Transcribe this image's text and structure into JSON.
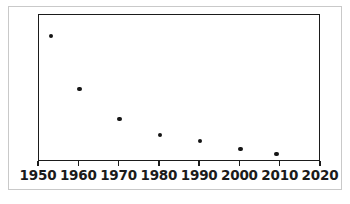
{
  "chart_data": {
    "type": "scatter",
    "title": "",
    "subtitle": "",
    "xlabel": "",
    "ylabel": "",
    "xlim": [
      1950,
      2020
    ],
    "ylim": [
      0,
      1
    ],
    "grid": false,
    "legend": null,
    "x_ticks": [
      1950,
      1960,
      1970,
      1980,
      1990,
      2000,
      2010,
      2020
    ],
    "x_tick_labels": [
      "1950",
      "1960",
      "1970",
      "1980",
      "1990",
      "2000",
      "2010",
      "2020"
    ],
    "y_ticks": [],
    "y_tick_labels": [],
    "marker": "filled-circle",
    "marker_color": "#141414",
    "series": [
      {
        "name": "series-1",
        "points": [
          {
            "x": 1953,
            "y": 0.857
          },
          {
            "x": 1960,
            "y": 0.497
          },
          {
            "x": 1970,
            "y": 0.293
          },
          {
            "x": 1980,
            "y": 0.184
          },
          {
            "x": 1990,
            "y": 0.143
          },
          {
            "x": 2000,
            "y": 0.088
          },
          {
            "x": 2009,
            "y": 0.054
          }
        ]
      }
    ]
  },
  "axes": {
    "frame_color": "#1b1b1b",
    "outer_border_color": "#c9c9c9",
    "background": "#ffffff"
  }
}
